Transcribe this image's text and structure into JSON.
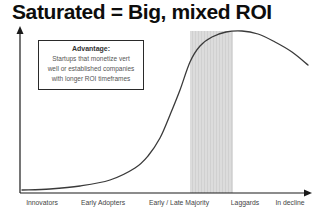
{
  "title": "Saturated = Big, mixed ROI",
  "annotation": {
    "heading": "Advantage:",
    "lines": [
      "Startups that monetize vert",
      "well or established companies",
      "with longer ROI timeframes"
    ]
  },
  "chart_data": {
    "type": "line",
    "title": "Saturated = Big, mixed ROI",
    "categories": [
      "Innovators",
      "Early Adopters",
      "Early / Late Majority",
      "Laggards",
      "In decline"
    ],
    "category_x_frac": [
      0.127,
      0.312,
      0.542,
      0.742,
      0.879
    ],
    "adoption_level_by_stage": [
      0.02,
      0.07,
      0.55,
      1.0,
      0.82
    ],
    "curve_points_px": [
      [
        22,
        190
      ],
      [
        50,
        189
      ],
      [
        80,
        186
      ],
      [
        110,
        180
      ],
      [
        135,
        168
      ],
      [
        148,
        156
      ],
      [
        160,
        138
      ],
      [
        170,
        115
      ],
      [
        180,
        90
      ],
      [
        190,
        62
      ],
      [
        200,
        46
      ],
      [
        212,
        37
      ],
      [
        226,
        32
      ],
      [
        242,
        31
      ],
      [
        258,
        34
      ],
      [
        275,
        42
      ],
      [
        292,
        52
      ],
      [
        308,
        65
      ]
    ],
    "highlight_band": {
      "x_start_px": 190,
      "x_end_px": 233,
      "y_top_px": 31,
      "y_bottom_px": 193,
      "region": "Laggards boundary",
      "color": "#d9d9d9"
    },
    "axis": {
      "x_arrow": true,
      "y_arrow": true,
      "xlabel": "",
      "ylabel": "",
      "grid": false
    }
  },
  "colors": {
    "background": "#ffffff",
    "curve": "#3a3a3a",
    "axis": "#1a1a1a",
    "band": "#dcdcdc",
    "band_stripe": "#d0d0d0",
    "title_text": "#0d0d0d",
    "annotation_text": "#555555",
    "label_text": "#444444"
  }
}
